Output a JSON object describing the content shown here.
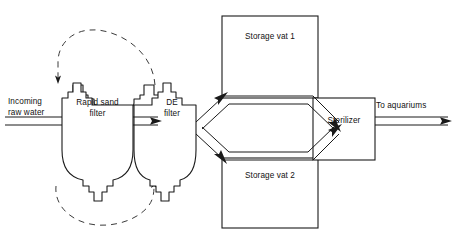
{
  "diagram": {
    "background_color": "#ffffff",
    "line_color": "#1a1a1a",
    "dashed_line_color": "#3a3a3a",
    "width": 455,
    "height": 239,
    "nodes": {
      "inflow": {
        "label_line1": "Incoming",
        "label_line2": "raw water",
        "shape": "double-line-arrow",
        "direction": "right"
      },
      "rapid_sand_filter": {
        "label_line1": "Rapid sand",
        "label_line2": "filter",
        "shape": "filter-vessel"
      },
      "de_filter": {
        "label_line1": "DE",
        "label_line2": "filter",
        "shape": "filter-vessel"
      },
      "storage_vat_1": {
        "label": "Storage vat 1",
        "shape": "rectangle"
      },
      "storage_vat_2": {
        "label": "Storage vat 2",
        "shape": "rectangle"
      },
      "sterilizer": {
        "label": "Sterilizer",
        "shape": "rectangle"
      },
      "outflow": {
        "label": "To aquariums",
        "shape": "double-line-arrow",
        "direction": "right"
      }
    },
    "flows": [
      {
        "from": "inflow",
        "to": "rapid_sand_filter",
        "style": "double-line",
        "arrow": true
      },
      {
        "from": "rapid_sand_filter",
        "to": "de_filter",
        "style": "double-line",
        "arrow": true
      },
      {
        "from": "de_filter",
        "to": "storage_vat_1",
        "style": "double-line",
        "arrow": true
      },
      {
        "from": "de_filter",
        "to": "storage_vat_2",
        "style": "double-line",
        "arrow": true
      },
      {
        "from": "storage_vat_1",
        "to": "sterilizer",
        "style": "double-line",
        "arrow": true
      },
      {
        "from": "storage_vat_2",
        "to": "sterilizer",
        "style": "double-line",
        "arrow": true
      },
      {
        "from": "sterilizer",
        "to": "outflow",
        "style": "double-line",
        "arrow": true
      },
      {
        "from": "de_filter",
        "to": "rapid_sand_filter",
        "style": "dashed-arc-top",
        "arrow": true
      },
      {
        "from": "rapid_sand_filter",
        "to": "de_filter",
        "style": "dashed-arc-bottom",
        "arrow": true
      }
    ]
  }
}
